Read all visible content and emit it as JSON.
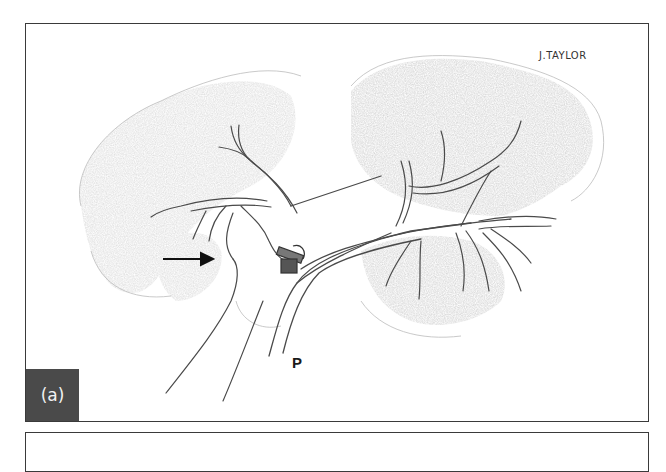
{
  "figure": {
    "panel_label": "(a)",
    "artist_signature": "J.TAYLOR",
    "annotations": [
      {
        "type": "arrow",
        "direction": "right",
        "label": ""
      },
      {
        "type": "letter",
        "label": "P"
      }
    ],
    "style": "pencil medical illustration",
    "colors": {
      "frame": "#3a3a3a",
      "label_bg": "#4a4a4a",
      "label_text": "#f2f2f2",
      "pencil": "#555555",
      "shading": "#b8b8b8"
    }
  }
}
